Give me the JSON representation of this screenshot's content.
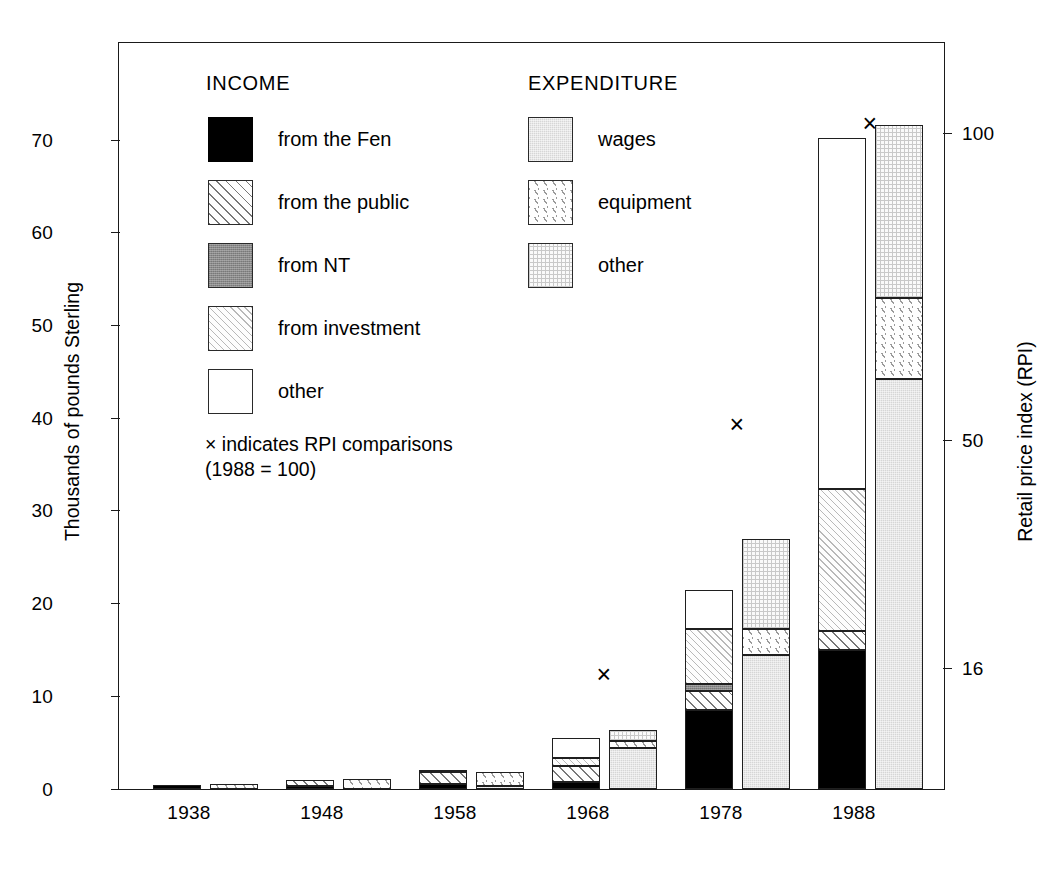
{
  "chart_data": {
    "type": "bar",
    "title": "",
    "subtitle": "",
    "categories": [
      "1938",
      "1948",
      "1958",
      "1968",
      "1978",
      "1988"
    ],
    "xlabel": "",
    "ylabel": "Thousands of pounds Sterling",
    "ylabel_right": "Retail price index (RPI)",
    "ylim": [
      0,
      80.6
    ],
    "yticks": [
      0,
      10,
      20,
      30,
      40,
      50,
      60,
      70
    ],
    "yticklabels": [
      "0",
      "10",
      "20",
      "30",
      "40",
      "50",
      "60",
      "70"
    ],
    "y2ticks_value": [
      16,
      50,
      100
    ],
    "y2ticklabels": [
      "16",
      "50",
      "100"
    ],
    "grid": false,
    "legend_position": "inside-upper-left",
    "annotation": "× indicates RPI comparisons\n(1988 = 100)",
    "groups": [
      {
        "name": "INCOME",
        "stacking": "stacked",
        "series": [
          {
            "name": "from the Fen",
            "key": "fen",
            "values": [
              0.45,
              0.3,
              0.55,
              0.75,
              8.55,
              15.05
            ]
          },
          {
            "name": "from the public",
            "key": "public",
            "values": [
              0.0,
              0.65,
              1.3,
              1.75,
              2.0,
              2.0
            ]
          },
          {
            "name": "from NT",
            "key": "nt",
            "values": [
              0.0,
              0.0,
              0.0,
              0.0,
              0.75,
              0.0
            ]
          },
          {
            "name": "from investment",
            "key": "invest",
            "values": [
              0.0,
              0.0,
              0.25,
              0.85,
              5.95,
              15.35
            ]
          },
          {
            "name": "other",
            "key": "other_i",
            "values": [
              0.0,
              0.0,
              0.0,
              2.15,
              4.25,
              37.8
            ]
          }
        ],
        "totals": [
          0.45,
          0.95,
          2.1,
          5.5,
          21.5,
          70.2
        ]
      },
      {
        "name": "EXPENDITURE",
        "stacking": "stacked",
        "series": [
          {
            "name": "wages",
            "key": "wages",
            "values": [
              0.0,
              0.0,
              0.3,
              4.45,
              14.45,
              44.2
            ]
          },
          {
            "name": "equipment",
            "key": "equip",
            "values": [
              0.55,
              1.05,
              1.5,
              0.7,
              2.85,
              8.8
            ]
          },
          {
            "name": "other",
            "key": "other_e",
            "values": [
              0.0,
              0.0,
              0.0,
              1.2,
              9.7,
              18.6
            ]
          }
        ],
        "totals": [
          0.55,
          1.05,
          1.8,
          6.35,
          27.0,
          71.6
        ]
      }
    ],
    "rpi_markers": [
      {
        "category": "1968",
        "left_axis_value": 12.3,
        "rpi": 16
      },
      {
        "category": "1978",
        "left_axis_value": 39.3,
        "rpi": 50
      },
      {
        "category": "1988",
        "left_axis_value": 71.8,
        "rpi": 100
      }
    ],
    "marker_symbol": "×"
  },
  "legend": {
    "income": {
      "heading": "INCOME",
      "items": [
        {
          "label": "from the Fen",
          "swatch": "solid-black-swatch"
        },
        {
          "label": "from the public",
          "swatch": "diagonal-hatch-swatch"
        },
        {
          "label": "from NT",
          "swatch": "dark-gray-swatch"
        },
        {
          "label": "from investment",
          "swatch": "light-diagonal-hatch-swatch"
        },
        {
          "label": "other",
          "swatch": "white-swatch"
        }
      ]
    },
    "expenditure": {
      "heading": "EXPENDITURE",
      "items": [
        {
          "label": "wages",
          "swatch": "gray-stipple-swatch"
        },
        {
          "label": "equipment",
          "swatch": "sparse-diagonal-hatch-swatch"
        },
        {
          "label": "other",
          "swatch": "fine-grid-swatch"
        }
      ]
    },
    "note_line1": "× indicates RPI comparisons",
    "note_line2": "(1988 = 100)"
  },
  "axes": {
    "left": {
      "title": "Thousands of pounds Sterling",
      "ticks": [
        "0",
        "10",
        "20",
        "30",
        "40",
        "50",
        "60",
        "70"
      ]
    },
    "right": {
      "title": "Retail price index (RPI)",
      "ticks": [
        "16",
        "50",
        "100"
      ]
    },
    "bottom": {
      "ticks": [
        "1938",
        "1948",
        "1958",
        "1968",
        "1978",
        "1988"
      ]
    }
  }
}
